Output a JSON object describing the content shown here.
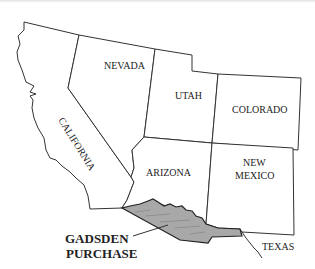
{
  "map": {
    "title": "Gadsden Purchase",
    "states": [
      {
        "id": "california",
        "label": "CALIFORNIA"
      },
      {
        "id": "nevada",
        "label": "NEVADA"
      },
      {
        "id": "utah",
        "label": "UTAH"
      },
      {
        "id": "colorado",
        "label": "COLORADO"
      },
      {
        "id": "arizona",
        "label": "ARIZONA"
      },
      {
        "id": "new-mexico",
        "label_line1": "NEW",
        "label_line2": "MEXICO"
      },
      {
        "id": "texas",
        "label": "TEXAS"
      }
    ],
    "callout": {
      "line1": "GADSDEN",
      "line2": "PURCHASE"
    },
    "colors": {
      "border": "#333333",
      "gadsden_fill": "#a8a8a8",
      "background": "#ffffff"
    }
  }
}
